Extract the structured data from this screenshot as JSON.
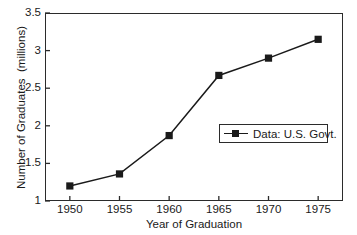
{
  "chart_data": {
    "type": "line",
    "title": "",
    "xlabel": "Year of Graduation",
    "ylabel": "Number of Graduates  (millions)",
    "x": [
      1950,
      1955,
      1960,
      1965,
      1970,
      1975
    ],
    "xticklabels": [
      "1950",
      "1955",
      "1960",
      "1965",
      "1970",
      "1975"
    ],
    "yticks": [
      1,
      1.5,
      2,
      2.5,
      3,
      3.5
    ],
    "yticklabels": [
      "1",
      "1.5",
      "2",
      "2.5",
      "3",
      "3.5"
    ],
    "xlim": [
      1947.5,
      1977.5
    ],
    "ylim": [
      1,
      3.5
    ],
    "grid": false,
    "legend_position": "center-right",
    "marker": "square",
    "line_color": "#1a1a1a",
    "marker_color": "#1a1a1a",
    "series": [
      {
        "name": "Data: U.S. Govt.",
        "values": [
          1.2,
          1.36,
          1.87,
          2.67,
          2.9,
          3.15
        ]
      }
    ]
  },
  "legend": {
    "entries": [
      {
        "label": "Data: U.S. Govt."
      }
    ]
  }
}
